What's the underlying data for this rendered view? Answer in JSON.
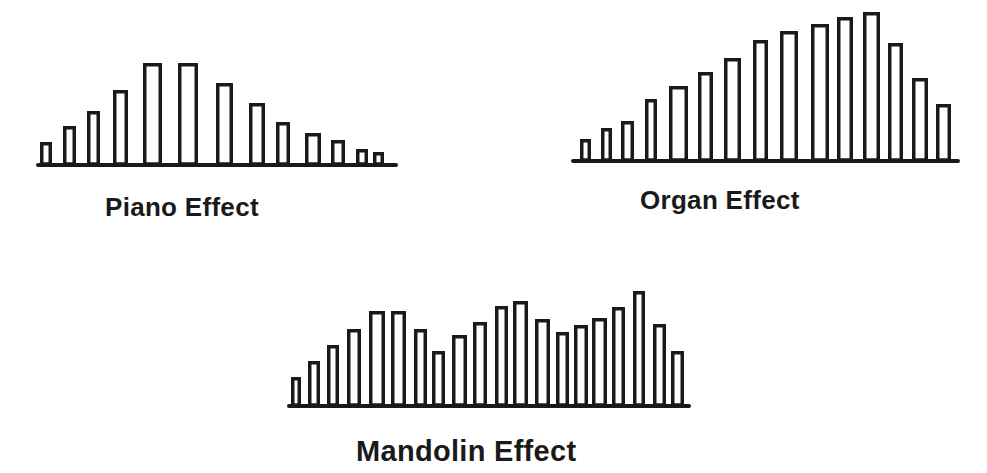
{
  "colors": {
    "ink": "#1a1a1a",
    "background": "#ffffff"
  },
  "chart_data": [
    {
      "type": "bar",
      "title": "Piano Effect",
      "xlabel": "",
      "ylabel": "",
      "grid": false,
      "style": "outlined bars, no axes ticks",
      "categories": [
        "1",
        "2",
        "3",
        "4",
        "5",
        "6",
        "7",
        "8",
        "9",
        "10",
        "11",
        "12",
        "13"
      ],
      "values": [
        22,
        38,
        53,
        74,
        101,
        101,
        81,
        61,
        42,
        31,
        24,
        15,
        12
      ],
      "layout": {
        "baseline_y": 164,
        "axis_x0": 38,
        "axis_x1": 396,
        "bars_x": [
          [
            40,
            52
          ],
          [
            63,
            76
          ],
          [
            87,
            100
          ],
          [
            113,
            128
          ],
          [
            143,
            162
          ],
          [
            178,
            198
          ],
          [
            216,
            233
          ],
          [
            249,
            265
          ],
          [
            276,
            290
          ],
          [
            305,
            321
          ],
          [
            331,
            345
          ],
          [
            356,
            368
          ],
          [
            373,
            384
          ]
        ]
      }
    },
    {
      "type": "bar",
      "title": "Organ Effect",
      "xlabel": "",
      "ylabel": "",
      "grid": false,
      "style": "outlined bars, no axes ticks",
      "categories": [
        "1",
        "2",
        "3",
        "4",
        "5",
        "6",
        "7",
        "8",
        "9",
        "10",
        "11",
        "12",
        "13",
        "14",
        "15"
      ],
      "values": [
        21,
        32,
        39,
        61,
        74,
        88,
        102,
        120,
        129,
        136,
        143,
        148,
        117,
        82,
        56
      ],
      "layout": {
        "baseline_y": 160,
        "axis_x0": 573,
        "axis_x1": 958,
        "bars_x": [
          [
            580,
            591
          ],
          [
            601,
            612
          ],
          [
            621,
            634
          ],
          [
            645,
            657
          ],
          [
            669,
            688
          ],
          [
            698,
            713
          ],
          [
            724,
            741
          ],
          [
            753,
            768
          ],
          [
            780,
            798
          ],
          [
            811,
            829
          ],
          [
            837,
            853
          ],
          [
            863,
            880
          ],
          [
            888,
            903
          ],
          [
            912,
            928
          ],
          [
            936,
            951
          ]
        ]
      }
    },
    {
      "type": "bar",
      "title": "Mandolin Effect",
      "xlabel": "",
      "ylabel": "",
      "grid": false,
      "style": "outlined bars, no axes ticks",
      "categories": [
        "1",
        "2",
        "3",
        "4",
        "5",
        "6",
        "7",
        "8",
        "9",
        "10",
        "11",
        "12",
        "13",
        "14",
        "15",
        "16",
        "17",
        "18",
        "19",
        "20"
      ],
      "values": [
        28,
        44,
        60,
        76,
        94,
        94,
        76,
        54,
        70,
        83,
        99,
        104,
        86,
        73,
        80,
        87,
        98,
        114,
        81,
        54
      ],
      "layout": {
        "baseline_y": 405,
        "axis_x0": 289,
        "axis_x1": 689,
        "bars_x": [
          [
            291,
            301
          ],
          [
            308,
            320
          ],
          [
            327,
            339
          ],
          [
            347,
            361
          ],
          [
            369,
            385
          ],
          [
            391,
            406
          ],
          [
            414,
            427
          ],
          [
            432,
            445
          ],
          [
            452,
            467
          ],
          [
            473,
            487
          ],
          [
            495,
            508
          ],
          [
            513,
            528
          ],
          [
            535,
            550
          ],
          [
            556,
            569
          ],
          [
            574,
            588
          ],
          [
            592,
            607
          ],
          [
            612,
            625
          ],
          [
            633,
            645
          ],
          [
            653,
            666
          ],
          [
            671,
            684
          ]
        ]
      }
    }
  ],
  "labels": {
    "piano": "Piano Effect",
    "organ": "Organ Effect",
    "mandolin": "Mandolin Effect"
  }
}
